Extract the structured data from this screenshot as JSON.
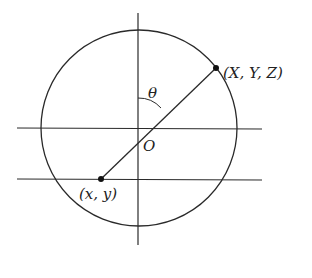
{
  "diagram": {
    "type": "stereographic-projection",
    "colors": {
      "stroke": "#2a2a2a",
      "background": "#ffffff",
      "text": "#222222"
    },
    "circle": {
      "cx": 139,
      "cy": 128,
      "r": 98
    },
    "vertical_axis": {
      "x": 138,
      "y1": 13,
      "y2": 245
    },
    "horizontal_lines": [
      {
        "name": "equator-plane",
        "y": 128,
        "x1": 17,
        "x2": 262
      },
      {
        "name": "projection-plane",
        "y": 179,
        "x1": 17,
        "x2": 262
      }
    ],
    "origin": {
      "x": 139,
      "y": 128,
      "label": "O"
    },
    "sphere_point": {
      "x": 216,
      "y": 68,
      "label": "(X, Y, Z)"
    },
    "plane_point": {
      "x": 101,
      "y": 179,
      "label": "(x, y)"
    },
    "angle": {
      "label": "θ",
      "arc_radius": 30
    }
  }
}
